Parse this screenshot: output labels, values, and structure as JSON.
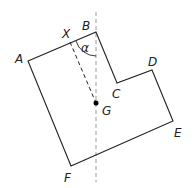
{
  "diagram": {
    "colors": {
      "outline": "#222222",
      "dashed_vertical": "#999999",
      "dashed_xg": "#222222",
      "point": "#000000"
    },
    "vertices": {
      "A": [
        28,
        61
      ],
      "B": [
        96,
        32
      ],
      "C": [
        117,
        83
      ],
      "D": [
        152,
        70
      ],
      "E": [
        173,
        121
      ],
      "F": [
        71,
        166
      ]
    },
    "points": {
      "X": [
        70,
        42
      ],
      "G": [
        96,
        103
      ]
    },
    "labels": {
      "A": "A",
      "B": "B",
      "C": "C",
      "D": "D",
      "E": "E",
      "F": "F",
      "X": "X",
      "G": "G",
      "angle": "α"
    },
    "vertical_line": {
      "x": 96,
      "y1": 12,
      "y2": 182
    }
  }
}
